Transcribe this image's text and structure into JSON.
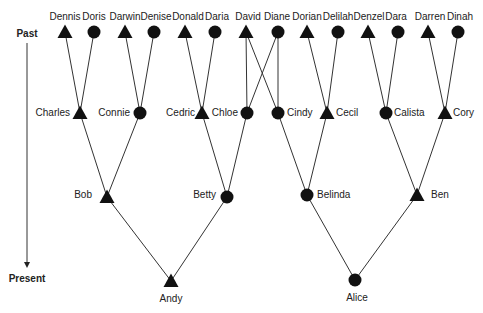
{
  "axis": {
    "past_label": "Past",
    "present_label": "Present",
    "x": 27,
    "top_y": 43,
    "bottom_y": 262
  },
  "legend_semantics": {
    "triangle": "male",
    "circle": "female"
  },
  "colors": {
    "symbol": "#111111",
    "line": "#333333",
    "text": "#222222"
  },
  "nodes": [
    {
      "id": "Dennis",
      "label": "Dennis",
      "shape": "triangle",
      "x": 65,
      "y": 32,
      "lx": 65,
      "ly": 20,
      "anchor": "middle"
    },
    {
      "id": "Doris",
      "label": "Doris",
      "shape": "circle",
      "x": 94,
      "y": 32,
      "lx": 94,
      "ly": 20,
      "anchor": "middle"
    },
    {
      "id": "Darwin",
      "label": "Darwin",
      "shape": "triangle",
      "x": 125,
      "y": 32,
      "lx": 125,
      "ly": 20,
      "anchor": "middle"
    },
    {
      "id": "Denise",
      "label": "Denise",
      "shape": "circle",
      "x": 154,
      "y": 32,
      "lx": 156,
      "ly": 20,
      "anchor": "middle"
    },
    {
      "id": "Donald",
      "label": "Donald",
      "shape": "triangle",
      "x": 185,
      "y": 32,
      "lx": 188,
      "ly": 20,
      "anchor": "middle"
    },
    {
      "id": "Daria",
      "label": "Daria",
      "shape": "circle",
      "x": 215,
      "y": 32,
      "lx": 217,
      "ly": 20,
      "anchor": "middle"
    },
    {
      "id": "David",
      "label": "David",
      "shape": "triangle",
      "x": 246,
      "y": 32,
      "lx": 248,
      "ly": 20,
      "anchor": "middle"
    },
    {
      "id": "Diane",
      "label": "Diane",
      "shape": "circle",
      "x": 278,
      "y": 32,
      "lx": 277,
      "ly": 20,
      "anchor": "middle"
    },
    {
      "id": "Dorian",
      "label": "Dorian",
      "shape": "triangle",
      "x": 307,
      "y": 32,
      "lx": 307,
      "ly": 20,
      "anchor": "middle"
    },
    {
      "id": "Delilah",
      "label": "Delilah",
      "shape": "circle",
      "x": 338,
      "y": 32,
      "lx": 338,
      "ly": 20,
      "anchor": "middle"
    },
    {
      "id": "Denzel",
      "label": "Denzel",
      "shape": "triangle",
      "x": 368,
      "y": 32,
      "lx": 369,
      "ly": 20,
      "anchor": "middle"
    },
    {
      "id": "Dara",
      "label": "Dara",
      "shape": "circle",
      "x": 398,
      "y": 32,
      "lx": 396,
      "ly": 20,
      "anchor": "middle"
    },
    {
      "id": "Darren",
      "label": "Darren",
      "shape": "triangle",
      "x": 428,
      "y": 32,
      "lx": 430,
      "ly": 20,
      "anchor": "middle"
    },
    {
      "id": "Dinah",
      "label": "Dinah",
      "shape": "circle",
      "x": 458,
      "y": 32,
      "lx": 460,
      "ly": 20,
      "anchor": "middle"
    },
    {
      "id": "Charles",
      "label": "Charles",
      "shape": "triangle",
      "x": 80,
      "y": 113,
      "lx": 70,
      "ly": 116,
      "anchor": "end"
    },
    {
      "id": "Connie",
      "label": "Connie",
      "shape": "circle",
      "x": 140,
      "y": 113,
      "lx": 130,
      "ly": 116,
      "anchor": "end"
    },
    {
      "id": "Cedric",
      "label": "Cedric",
      "shape": "triangle",
      "x": 202,
      "y": 113,
      "lx": 195,
      "ly": 116,
      "anchor": "end"
    },
    {
      "id": "Chloe",
      "label": "Chloe",
      "shape": "circle",
      "x": 247,
      "y": 113,
      "lx": 238,
      "ly": 116,
      "anchor": "end"
    },
    {
      "id": "Cindy",
      "label": "Cindy",
      "shape": "circle",
      "x": 278,
      "y": 113,
      "lx": 287,
      "ly": 116,
      "anchor": "start"
    },
    {
      "id": "Cecil",
      "label": "Cecil",
      "shape": "triangle",
      "x": 327,
      "y": 113,
      "lx": 336,
      "ly": 116,
      "anchor": "start"
    },
    {
      "id": "Calista",
      "label": "Calista",
      "shape": "circle",
      "x": 386,
      "y": 113,
      "lx": 394,
      "ly": 116,
      "anchor": "start"
    },
    {
      "id": "Cory",
      "label": "Cory",
      "shape": "triangle",
      "x": 445,
      "y": 113,
      "lx": 453,
      "ly": 116,
      "anchor": "start"
    },
    {
      "id": "Bob",
      "label": "Bob",
      "shape": "triangle",
      "x": 107,
      "y": 197,
      "lx": 92,
      "ly": 198,
      "anchor": "end"
    },
    {
      "id": "Betty",
      "label": "Betty",
      "shape": "circle",
      "x": 227,
      "y": 197,
      "lx": 216,
      "ly": 198,
      "anchor": "end"
    },
    {
      "id": "Belinda",
      "label": "Belinda",
      "shape": "circle",
      "x": 307,
      "y": 195,
      "lx": 317,
      "ly": 198,
      "anchor": "start"
    },
    {
      "id": "Ben",
      "label": "Ben",
      "shape": "triangle",
      "x": 417,
      "y": 195,
      "lx": 431,
      "ly": 198,
      "anchor": "start"
    },
    {
      "id": "Andy",
      "label": "Andy",
      "shape": "triangle",
      "x": 171,
      "y": 281,
      "lx": 171,
      "ly": 302,
      "anchor": "middle"
    },
    {
      "id": "Alice",
      "label": "Alice",
      "shape": "circle",
      "x": 355,
      "y": 280,
      "lx": 357,
      "ly": 301,
      "anchor": "middle"
    }
  ],
  "edges": [
    [
      "Dennis",
      "Charles"
    ],
    [
      "Doris",
      "Charles"
    ],
    [
      "Darwin",
      "Connie"
    ],
    [
      "Denise",
      "Connie"
    ],
    [
      "Donald",
      "Cedric"
    ],
    [
      "Daria",
      "Cedric"
    ],
    [
      "David",
      "Chloe"
    ],
    [
      "Diane",
      "Chloe"
    ],
    [
      "David",
      "Cindy"
    ],
    [
      "Diane",
      "Cindy"
    ],
    [
      "Dorian",
      "Cecil"
    ],
    [
      "Delilah",
      "Cecil"
    ],
    [
      "Denzel",
      "Calista"
    ],
    [
      "Dara",
      "Calista"
    ],
    [
      "Darren",
      "Cory"
    ],
    [
      "Dinah",
      "Cory"
    ],
    [
      "Charles",
      "Bob"
    ],
    [
      "Connie",
      "Bob"
    ],
    [
      "Cedric",
      "Betty"
    ],
    [
      "Chloe",
      "Betty"
    ],
    [
      "Cindy",
      "Belinda"
    ],
    [
      "Cecil",
      "Belinda"
    ],
    [
      "Calista",
      "Ben"
    ],
    [
      "Cory",
      "Ben"
    ],
    [
      "Bob",
      "Andy"
    ],
    [
      "Betty",
      "Andy"
    ],
    [
      "Belinda",
      "Alice"
    ],
    [
      "Ben",
      "Alice"
    ]
  ]
}
